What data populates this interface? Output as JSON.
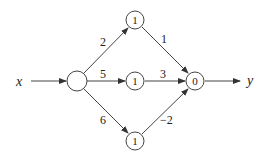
{
  "diagram": {
    "type": "neural-network",
    "input_label": "x",
    "output_label": "y",
    "nodes": [
      {
        "id": "input",
        "value": "",
        "cx": 77,
        "cy": 81
      },
      {
        "id": "hidden-top",
        "value": "1",
        "cx": 135,
        "cy": 20
      },
      {
        "id": "hidden-middle",
        "value": "1",
        "cx": 135,
        "cy": 81
      },
      {
        "id": "hidden-bottom",
        "value": "1",
        "cx": 135,
        "cy": 141
      },
      {
        "id": "output",
        "value": "0",
        "cx": 195,
        "cy": 81
      }
    ],
    "edges": [
      {
        "from": "x",
        "to": "input",
        "weight": ""
      },
      {
        "from": "input",
        "to": "hidden-top",
        "weight": "2"
      },
      {
        "from": "input",
        "to": "hidden-middle",
        "weight": "5"
      },
      {
        "from": "input",
        "to": "hidden-bottom",
        "weight": "6"
      },
      {
        "from": "hidden-top",
        "to": "output",
        "weight": "1"
      },
      {
        "from": "hidden-middle",
        "to": "output",
        "weight": "3"
      },
      {
        "from": "hidden-bottom",
        "to": "output",
        "weight": "−2"
      },
      {
        "from": "output",
        "to": "y",
        "weight": ""
      }
    ]
  }
}
